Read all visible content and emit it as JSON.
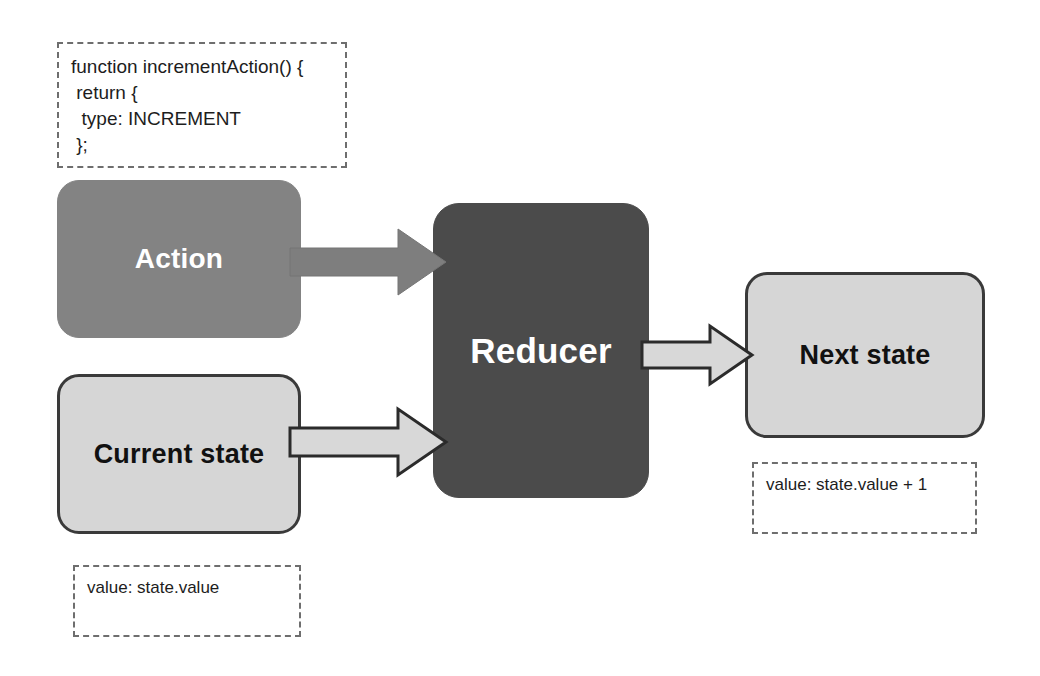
{
  "diagram": {
    "code_note": {
      "id": "action-creator-code",
      "lines": [
        "function incrementAction() {",
        " return {",
        "  type: INCREMENT",
        " };"
      ],
      "text": "function incrementAction() {\n return {\n  type: INCREMENT\n };"
    },
    "nodes": [
      {
        "id": "action",
        "label": "Action",
        "fill": "#838383",
        "text_color": "#ffffff"
      },
      {
        "id": "reducer",
        "label": "Reducer",
        "fill": "#4b4b4b",
        "text_color": "#ffffff"
      },
      {
        "id": "current-state",
        "label": "Current state",
        "fill": "#d6d6d6",
        "text_color": "#111111"
      },
      {
        "id": "next-state",
        "label": "Next state",
        "fill": "#d6d6d6",
        "text_color": "#111111"
      }
    ],
    "notes": [
      {
        "id": "current-state-note",
        "text": "value: state.value"
      },
      {
        "id": "next-state-note",
        "text": "value: state.value + 1"
      }
    ],
    "arrows": [
      {
        "id": "action-to-reducer",
        "from": "action",
        "to": "reducer",
        "style": "solid-gray",
        "fill": "#7e7e7e",
        "stroke": "#6f6f6f"
      },
      {
        "id": "current-state-to-reducer",
        "from": "current-state",
        "to": "reducer",
        "style": "outlined-light",
        "fill": "#d8d8d8",
        "stroke": "#2b2b2b"
      },
      {
        "id": "reducer-to-next-state",
        "from": "reducer",
        "to": "next-state",
        "style": "outlined-light",
        "fill": "#d8d8d8",
        "stroke": "#2b2b2b"
      }
    ],
    "colors": {
      "background": "#ffffff",
      "dark_node": "#4b4b4b",
      "mid_node": "#838383",
      "light_node": "#d6d6d6",
      "node_border": "#3a3a3a",
      "dashed_border": "#6e6e6e",
      "text_dark": "#1d1d1d",
      "text_light": "#ffffff"
    }
  }
}
